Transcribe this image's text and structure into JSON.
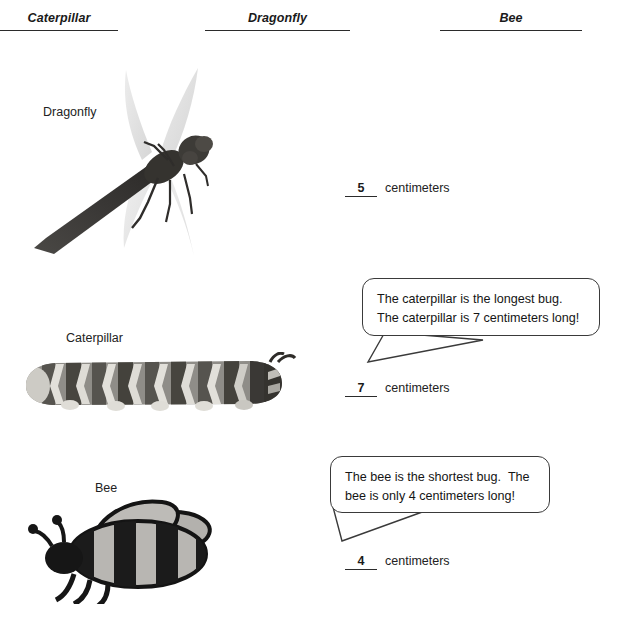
{
  "page": {
    "background_color": "#ffffff",
    "ink_color": "#1a1a1a"
  },
  "header_blanks": [
    {
      "label": "Caterpillar",
      "name": "header-blank-caterpillar"
    },
    {
      "label": "Dragonfly",
      "name": "header-blank-dragonfly"
    },
    {
      "label": "Bee",
      "name": "header-blank-bee"
    }
  ],
  "specimens": [
    {
      "key": "dragonfly",
      "picture_label": "Dragonfly",
      "image_kind": "dragonfly-photo",
      "measurement": {
        "value": "5",
        "unit": "centimeters"
      }
    },
    {
      "key": "caterpillar",
      "picture_label": "Caterpillar",
      "image_kind": "caterpillar-photo",
      "measurement": {
        "value": "7",
        "unit": "centimeters"
      }
    },
    {
      "key": "bee",
      "picture_label": "Bee",
      "image_kind": "bee-clipart",
      "measurement": {
        "value": "4",
        "unit": "centimeters"
      }
    }
  ],
  "speech_bubbles": [
    {
      "key": "caterpillar",
      "line1": "The caterpillar is the longest bug.",
      "line2": "The caterpillar is 7 centimeters long!"
    },
    {
      "key": "bee",
      "line1": "The bee is the shortest bug.  The",
      "line2": "bee is only 4 centimeters long!"
    }
  ]
}
